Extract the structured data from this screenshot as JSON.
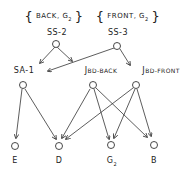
{
  "diagram": {
    "type": "tree-graph",
    "sets": [
      {
        "id": "ss2_set",
        "open": "{",
        "text": "BACK, G",
        "sub": "2",
        "close": "}"
      },
      {
        "id": "ss3_set",
        "open": "{",
        "text": "FRONT, G",
        "sub": "2",
        "close": "}"
      }
    ],
    "nodes": {
      "ss2": {
        "label": "SS-2"
      },
      "ss3": {
        "label": "SS-3"
      },
      "sa1": {
        "label": "SA-1"
      },
      "jbd_back": {
        "label": "J",
        "sub": "BD-BACK"
      },
      "jbd_front": {
        "label": "J",
        "sub": "BD-FRONT"
      },
      "e": {
        "label": "E"
      },
      "d": {
        "label": "D"
      },
      "g2": {
        "label": "G",
        "sub": "2"
      },
      "b": {
        "label": "B"
      }
    },
    "edges": [
      [
        "SS-2",
        "SA-1"
      ],
      [
        "SS-2",
        "JBD-BACK"
      ],
      [
        "SS-3",
        "SA-1"
      ],
      [
        "SS-3",
        "JBD-FRONT"
      ],
      [
        "SA-1",
        "E"
      ],
      [
        "SA-1",
        "D"
      ],
      [
        "JBD-BACK",
        "D"
      ],
      [
        "JBD-BACK",
        "G2"
      ],
      [
        "JBD-BACK",
        "B"
      ],
      [
        "JBD-FRONT",
        "D"
      ],
      [
        "JBD-FRONT",
        "G2"
      ],
      [
        "JBD-FRONT",
        "B"
      ]
    ]
  }
}
